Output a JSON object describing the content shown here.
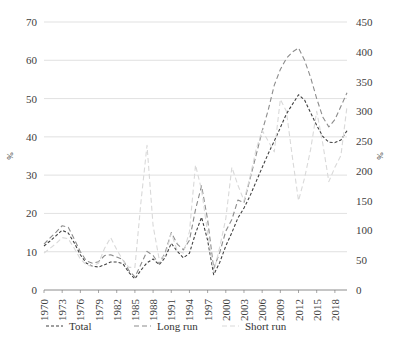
{
  "chart_data": {
    "type": "line",
    "title": "",
    "subtitle": "",
    "xlabel": "",
    "ylabel": "%",
    "ylabel_right": "%",
    "grid": true,
    "legend_position": "bottom",
    "x_tick_labels": [
      "1970",
      "1973",
      "1976",
      "1979",
      "1982",
      "1985",
      "1988",
      "1991",
      "1994",
      "1997",
      "2000",
      "2003",
      "2006",
      "2009",
      "2012",
      "2015",
      "2018"
    ],
    "x_tick_step_years": 3,
    "x_start_year": 1970,
    "x_end_year": 2020,
    "ylim_left": [
      0,
      70
    ],
    "ylim_right": [
      0,
      450
    ],
    "y_ticks_left": [
      0,
      10,
      20,
      30,
      40,
      50,
      60,
      70
    ],
    "y_ticks_right": [
      0,
      50,
      100,
      150,
      200,
      250,
      300,
      350,
      400,
      450
    ],
    "series": [
      {
        "name": "Total",
        "axis": "left",
        "color": "#404040",
        "dash": "3,2",
        "width": 1.1,
        "years": [
          1970,
          1971,
          1972,
          1973,
          1974,
          1975,
          1976,
          1977,
          1978,
          1979,
          1980,
          1981,
          1982,
          1983,
          1984,
          1985,
          1986,
          1987,
          1988,
          1989,
          1990,
          1991,
          1992,
          1993,
          1994,
          1995,
          1996,
          1997,
          1998,
          1999,
          2000,
          2001,
          2002,
          2003,
          2004,
          2005,
          2006,
          2007,
          2008,
          2009,
          2010,
          2011,
          2012,
          2013,
          2014,
          2015,
          2016,
          2017,
          2018,
          2019,
          2020
        ],
        "values": [
          11.5,
          12.8,
          14.2,
          15.6,
          14.9,
          12.3,
          9.2,
          7.0,
          6.2,
          6.0,
          6.6,
          7.3,
          7.3,
          6.9,
          4.6,
          2.9,
          5.2,
          7.1,
          8.1,
          6.6,
          8.5,
          12.2,
          10.1,
          8.4,
          9.6,
          14.8,
          19.0,
          13.0,
          4.0,
          7.2,
          11.5,
          15.0,
          18.8,
          21.4,
          24.6,
          28.3,
          32.0,
          35.6,
          38.9,
          42.4,
          46.0,
          48.5,
          51.0,
          49.6,
          46.3,
          43.0,
          40.1,
          38.6,
          38.5,
          39.2,
          41.6
        ]
      },
      {
        "name": "Long run",
        "axis": "left",
        "color": "#8c8c8c",
        "dash": "5,3",
        "width": 1.1,
        "years": [
          1970,
          1971,
          1972,
          1973,
          1974,
          1975,
          1976,
          1977,
          1978,
          1979,
          1980,
          1981,
          1982,
          1983,
          1984,
          1985,
          1986,
          1987,
          1988,
          1989,
          1990,
          1991,
          1992,
          1993,
          1994,
          1995,
          1996,
          1997,
          1998,
          1999,
          2000,
          2001,
          2002,
          2003,
          2004,
          2005,
          2006,
          2007,
          2008,
          2009,
          2010,
          2011,
          2012,
          2013,
          2014,
          2015,
          2016,
          2017,
          2018,
          2019,
          2020
        ],
        "values": [
          12.0,
          13.6,
          15.1,
          16.8,
          16.4,
          13.3,
          10.0,
          7.6,
          7.0,
          7.4,
          9.0,
          9.2,
          8.6,
          8.0,
          5.1,
          3.4,
          6.7,
          10.1,
          9.0,
          6.8,
          9.8,
          15.0,
          12.0,
          10.5,
          13.0,
          21.0,
          27.2,
          18.4,
          5.6,
          9.8,
          15.4,
          18.4,
          23.5,
          22.8,
          29.0,
          35.2,
          41.5,
          47.0,
          53.5,
          57.6,
          60.5,
          62.2,
          63.2,
          60.0,
          55.5,
          50.0,
          45.2,
          42.6,
          44.5,
          48.0,
          51.5
        ]
      },
      {
        "name": "Short run",
        "axis": "right",
        "color": "#d9d9d9",
        "dash": "5,3",
        "width": 1.1,
        "years": [
          1970,
          1971,
          1972,
          1973,
          1974,
          1975,
          1976,
          1977,
          1978,
          1979,
          1980,
          1981,
          1982,
          1983,
          1984,
          1985,
          1986,
          1987,
          1988,
          1989,
          1990,
          1991,
          1992,
          1993,
          1994,
          1995,
          1996,
          1997,
          1998,
          1999,
          2000,
          2001,
          2002,
          2003,
          2004,
          2005,
          2006,
          2007,
          2008,
          2009,
          2010,
          2011,
          2012,
          2013,
          2014,
          2015,
          2016,
          2017,
          2018,
          2019,
          2020
        ],
        "values": [
          62,
          70,
          78,
          88,
          86,
          70,
          52,
          42,
          40,
          45,
          70,
          88,
          68,
          50,
          38,
          38,
          148,
          243,
          108,
          52,
          58,
          95,
          66,
          62,
          98,
          210,
          168,
          96,
          30,
          72,
          120,
          206,
          176,
          150,
          190,
          236,
          268,
          250,
          232,
          320,
          300,
          222,
          150,
          188,
          236,
          300,
          246,
          182,
          206,
          226,
          308
        ]
      }
    ]
  },
  "legend": {
    "items": [
      {
        "label": "Total",
        "color": "#404040",
        "dash": "3,2"
      },
      {
        "label": "Long run",
        "color": "#8c8c8c",
        "dash": "5,3"
      },
      {
        "label": "Short run",
        "color": "#d9d9d9",
        "dash": "5,3"
      }
    ]
  },
  "colors": {
    "total": "#404040",
    "long_run": "#8c8c8c",
    "short_run": "#d9d9d9",
    "gridline": "#d9d9d9",
    "axis": "#808080",
    "text": "#404040",
    "background": "#ffffff"
  }
}
